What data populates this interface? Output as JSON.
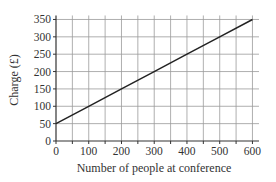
{
  "chart_data": {
    "type": "line",
    "title": "",
    "xlabel": "Number of people at conference",
    "ylabel": "Charge (£)",
    "xlim": [
      0,
      620
    ],
    "ylim": [
      0,
      360
    ],
    "xticks": [
      0,
      100,
      200,
      300,
      400,
      500,
      600
    ],
    "yticks": [
      0,
      50,
      100,
      150,
      200,
      250,
      300,
      350
    ],
    "x_minor_grid_step": 50,
    "y_grid_step": 50,
    "grid": true,
    "legend": null,
    "series": [
      {
        "name": "Charge",
        "x": [
          0,
          100,
          200,
          300,
          400,
          500,
          600
        ],
        "values": [
          50,
          100,
          150,
          200,
          250,
          300,
          350
        ]
      }
    ],
    "colors": {
      "line": "#222222",
      "grid": "#9a9a9a",
      "axis": "#333333"
    }
  }
}
